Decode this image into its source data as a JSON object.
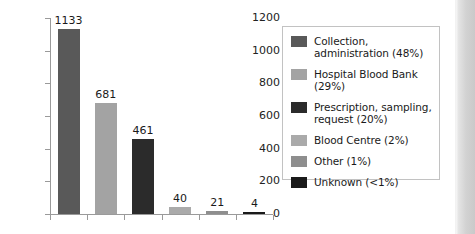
{
  "chart_data": {
    "type": "bar",
    "title": "",
    "xlabel": "",
    "ylabel": "",
    "categories": [
      "Collection, administration",
      "Hospital Blood Bank",
      "Prescription, sampling, request",
      "Blood Centre",
      "Other",
      "Unknown"
    ],
    "values": [
      1133,
      681,
      461,
      40,
      21,
      4
    ],
    "data_labels": [
      "1133",
      "681",
      "461",
      "40",
      "21",
      "4"
    ],
    "ylim": [
      0,
      1200
    ],
    "ytick_labels": [
      "1200",
      "1000",
      "800",
      "600",
      "400",
      "200",
      "0"
    ],
    "ytick_values": [
      1200,
      1000,
      800,
      600,
      400,
      200,
      0
    ],
    "grid": false,
    "legend_position": "right",
    "bar_colors": [
      "#595959",
      "#a3a3a3",
      "#2b2b2b",
      "#aaaaaa",
      "#8e8e8e",
      "#1a1a1a"
    ]
  },
  "legend": {
    "items": [
      {
        "label": "Collection, administration (48%)",
        "color": "#595959"
      },
      {
        "label": "Hospital Blood Bank (29%)",
        "color": "#a3a3a3"
      },
      {
        "label": "Prescription, sampling, request (20%)",
        "color": "#2b2b2b"
      },
      {
        "label": "Blood Centre (2%)",
        "color": "#aaaaaa"
      },
      {
        "label": "Other (1%)",
        "color": "#8e8e8e"
      },
      {
        "label": "Unknown (<1%)",
        "color": "#1a1a1a"
      }
    ]
  },
  "colors": {
    "axis": "#9a9a9a",
    "legend_border": "#c2c2c2",
    "background": "#ffffff",
    "text": "#1a1a1a"
  }
}
